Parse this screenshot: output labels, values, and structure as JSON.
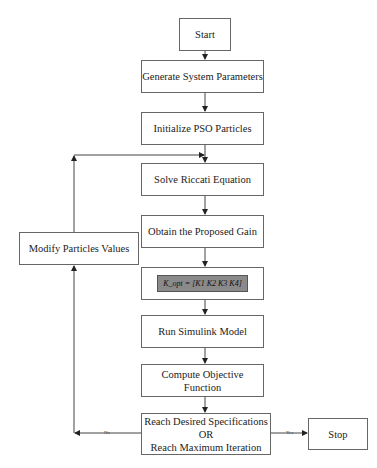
{
  "flowchart": {
    "start": "Start",
    "generate": "Generate System Parameters",
    "initialize": "Initialize PSO Particles",
    "solve": "Solve Riccati Equation",
    "obtain": "Obtain the Proposed Gain",
    "equation": "K_opt = [K1  K2  K3  K4]",
    "run": "Run Simulink Model",
    "compute": "Compute Objective Function",
    "decision_line1": "Reach Desired Specifications",
    "decision_line2": "OR",
    "decision_line3": "Reach Maximum Iteration",
    "stop": "Stop",
    "modify": "Modify Particles Values",
    "no_label": "No",
    "yes_label": "Yes"
  }
}
